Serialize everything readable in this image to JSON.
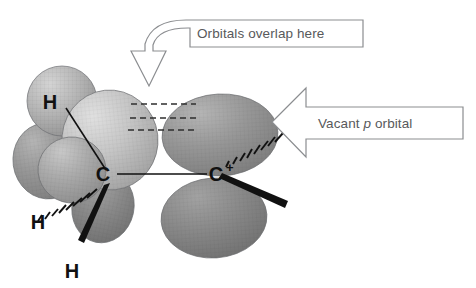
{
  "figure": {
    "background_color": "#ffffff"
  },
  "callouts": [
    {
      "id": "overlap",
      "text": "Orbitals overlap here",
      "icon": "curved-down-arrow-icon",
      "direction": "down",
      "outline_color": "#8b8d90",
      "text_color": "#58595b"
    },
    {
      "id": "vacant_p",
      "text_before": "Vacant ",
      "text_italic": "p",
      "text_after": " orbital",
      "text_full": "Vacant p orbital",
      "icon": "left-block-arrow-icon",
      "direction": "left",
      "outline_color": "#8b8d90",
      "text_color": "#58595b"
    }
  ],
  "atoms": [
    {
      "id": "c_left",
      "label": "C",
      "charge": "",
      "role": "sp3-carbon"
    },
    {
      "id": "c_right",
      "label": "C",
      "charge": "+",
      "role": "carbocation"
    },
    {
      "id": "h_top",
      "label": "H",
      "bond_style": "plain-line"
    },
    {
      "id": "h_left",
      "label": "H",
      "bond_style": "hashed-wedge"
    },
    {
      "id": "h_bottom",
      "label": "H",
      "bond_style": "bold-wedge"
    }
  ],
  "bonds": [
    {
      "id": "c_c",
      "from": "c_left",
      "to": "c_right",
      "style": "plain-line"
    },
    {
      "id": "c_h_top",
      "from": "c_left",
      "to": "h_top",
      "style": "plain-line"
    },
    {
      "id": "c_h_left",
      "from": "c_left",
      "to": "h_left",
      "style": "hashed-wedge"
    },
    {
      "id": "c_h_bottom",
      "from": "c_left",
      "to": "h_bottom",
      "style": "bold-wedge"
    },
    {
      "id": "cplus_sub_up",
      "from": "c_right",
      "to": "substituent-up",
      "style": "hashed-wedge"
    },
    {
      "id": "cplus_sub_down",
      "from": "c_right",
      "to": "substituent-down",
      "style": "bold-wedge"
    }
  ],
  "orbitals": {
    "overlap_dashes": 3,
    "left_carbon_lobes": 4,
    "right_carbon_lobes": 2,
    "shading": {
      "light": "#c9c9c9",
      "mid": "#a8a8a8",
      "dark": "#8a8a8a",
      "darker": "#787878"
    }
  }
}
